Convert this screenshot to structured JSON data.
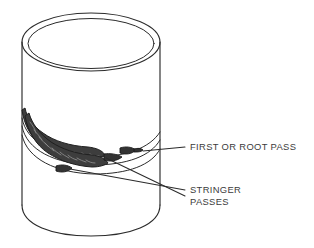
{
  "figure": {
    "background_color": "#ffffff",
    "line_color": "#2b2b2b",
    "weld_color": "#3d3d3d",
    "text_color": "#3b3b3b"
  },
  "labels": {
    "first_or_root_pass": "FIRST OR ROOT PASS",
    "stringer_line_1": "STRINGER",
    "stringer_line_2": "PASSES"
  },
  "parts": {
    "pipe": "pipe-cylinder",
    "pipe_top_rim": "pipe-top-rim-ellipse",
    "pipe_wall": "pipe-wall-thickness-ellipse",
    "pipe_bottom": "pipe-bottom-arc",
    "root_pass_bead": "root-pass-weld-bead",
    "stringer_bead_upper": "stringer-pass-weld-bead-upper",
    "stringer_bead_lower": "stringer-pass-weld-bead-lower",
    "weld_seam_arcs": "weld-seam-arcs"
  },
  "leaders": {
    "first_or_root_pass_count": 1,
    "stringer_passes_count": 2
  }
}
